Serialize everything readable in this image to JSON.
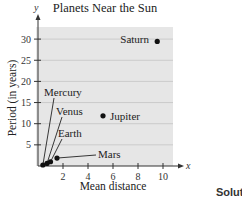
{
  "chart_data": {
    "type": "scatter",
    "title": "Planets Near the Sun",
    "xlabel": "Mean distance",
    "ylabel": "Period (in years)",
    "x_axis_symbol": "x",
    "y_axis_symbol": "y",
    "xlim": [
      0,
      11
    ],
    "ylim": [
      0,
      32
    ],
    "x_ticks": [
      2,
      4,
      6,
      8,
      10
    ],
    "y_ticks": [
      5,
      10,
      15,
      20,
      25,
      30
    ],
    "grid": "horizontal",
    "background": "#e6e6e6",
    "points": [
      {
        "name": "Mercury",
        "x": 0.39,
        "y": 0.24
      },
      {
        "name": "Venus",
        "x": 0.72,
        "y": 0.62
      },
      {
        "name": "Earth",
        "x": 1.0,
        "y": 1.0
      },
      {
        "name": "Mars",
        "x": 1.52,
        "y": 1.88
      },
      {
        "name": "Jupiter",
        "x": 5.2,
        "y": 11.86
      },
      {
        "name": "Saturn",
        "x": 9.54,
        "y": 29.46
      }
    ]
  },
  "page": {
    "title": "Planets Near the Sun",
    "xlabel": "Mean distance",
    "ylabel": "Period (in years)",
    "cut_off_text": "Solut"
  }
}
